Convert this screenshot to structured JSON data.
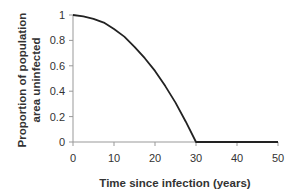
{
  "chart_data": {
    "type": "line",
    "title": "",
    "xlabel": "Time since infection (years)",
    "ylabel_lines": [
      "Proportion of population",
      "area uninfected"
    ],
    "ylabel": "Proportion of population area uninfected",
    "xlim": [
      0,
      50
    ],
    "ylim": [
      0,
      1
    ],
    "x_ticks": [
      "0",
      "10",
      "20",
      "30",
      "40",
      "50"
    ],
    "y_ticks": [
      "0",
      "0.2",
      "0.4",
      "0.6",
      "0.8",
      "1"
    ],
    "grid": false,
    "legend": null,
    "series": [
      {
        "name": "Proportion uninfected",
        "color": "#222222",
        "x": [
          0,
          2.5,
          5,
          7.5,
          10,
          12.5,
          15,
          17.5,
          20,
          22.5,
          25,
          27.5,
          30,
          35,
          40,
          45,
          50
        ],
        "y": [
          1,
          0.99,
          0.97,
          0.94,
          0.89,
          0.83,
          0.75,
          0.66,
          0.56,
          0.44,
          0.31,
          0.16,
          0,
          0,
          0,
          0,
          0
        ]
      }
    ]
  },
  "axis_color": "#999999"
}
